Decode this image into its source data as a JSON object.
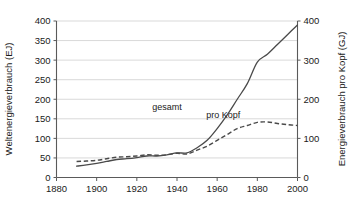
{
  "chart_data": {
    "type": "line",
    "title": "",
    "subtitle": "",
    "xlabel": "",
    "ylabel": "Weltenergieverbrauch (EJ)",
    "y2label": "Energieverbrauch pro Kopf (GJ)",
    "xlim": [
      1880,
      2000
    ],
    "ylim": [
      0,
      400
    ],
    "y2lim": [
      0,
      400
    ],
    "grid": true,
    "legend_position": "inline-annotations",
    "x_ticks": [
      1880,
      1900,
      1920,
      1940,
      1960,
      1980,
      2000
    ],
    "x_tick_labels": [
      "1880",
      "1900",
      "1920",
      "1940",
      "1960",
      "1980",
      "2000"
    ],
    "y_ticks": [
      0,
      50,
      100,
      150,
      200,
      250,
      300,
      350,
      400
    ],
    "y_tick_labels": [
      "0",
      "50",
      "100",
      "150",
      "200",
      "250",
      "300",
      "350",
      "400"
    ],
    "y2_ticks": [
      0,
      100,
      200,
      300,
      400
    ],
    "y2_tick_labels": [
      "0",
      "100",
      "200",
      "300",
      "400"
    ],
    "series": [
      {
        "name": "gesamt",
        "label": "gesamt",
        "axis": "left",
        "style": "solid",
        "color": "#4a4a4a",
        "label_x": 1935,
        "label_y": 172,
        "x": [
          1890,
          1895,
          1900,
          1905,
          1910,
          1915,
          1920,
          1925,
          1930,
          1935,
          1940,
          1945,
          1950,
          1955,
          1960,
          1965,
          1970,
          1975,
          1980,
          1985,
          1990,
          1995,
          2000
        ],
        "y": [
          29,
          32,
          36,
          41,
          46,
          48,
          51,
          55,
          55,
          58,
          63,
          63,
          76,
          95,
          125,
          160,
          200,
          240,
          295,
          315,
          340,
          365,
          390
        ]
      },
      {
        "name": "pro_kopf",
        "label": "pro Kopf",
        "axis": "right",
        "style": "dashed",
        "color": "#4a4a4a",
        "label_x": 1963,
        "label_y": 152,
        "x": [
          1890,
          1895,
          1900,
          1905,
          1910,
          1915,
          1920,
          1925,
          1930,
          1935,
          1940,
          1945,
          1950,
          1955,
          1960,
          1965,
          1970,
          1975,
          1980,
          1985,
          1990,
          1995,
          2000
        ],
        "y": [
          41,
          42,
          44,
          48,
          52,
          53,
          55,
          58,
          57,
          58,
          62,
          60,
          70,
          80,
          95,
          110,
          125,
          133,
          141,
          142,
          138,
          135,
          133
        ]
      }
    ]
  }
}
